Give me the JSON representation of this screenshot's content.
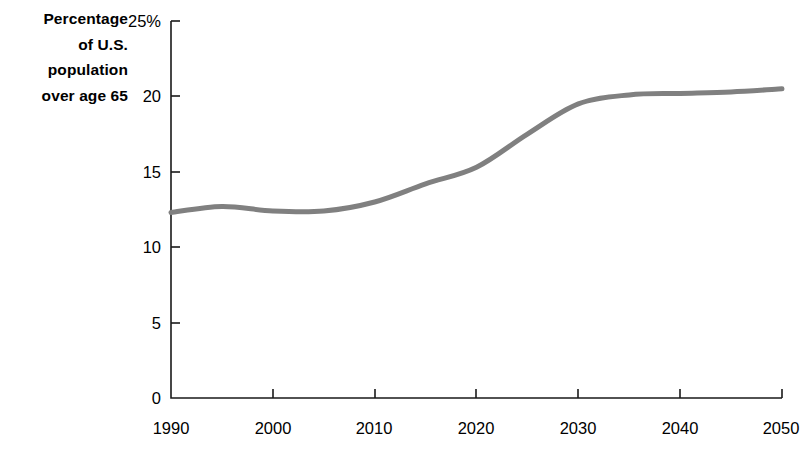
{
  "chart_data": {
    "type": "line",
    "title": "",
    "ylabel_lines": [
      "Percentage",
      "of U.S.",
      "population",
      "over age 65"
    ],
    "ylabel": "Percentage of U.S. population over age 65",
    "xlabel": "",
    "xlim": [
      1990,
      2050
    ],
    "ylim": [
      0,
      25
    ],
    "grid": false,
    "legend": null,
    "y_tick_labels": [
      "25%",
      "20",
      "15",
      "10",
      "5",
      "0"
    ],
    "y_tick_values": [
      25,
      20,
      15,
      10,
      5,
      0
    ],
    "x_tick_labels": [
      "1990",
      "2000",
      "2010",
      "2020",
      "2030",
      "2040",
      "2050"
    ],
    "x_tick_values": [
      1990,
      2000,
      2010,
      2020,
      2030,
      2040,
      2050
    ],
    "series": [
      {
        "name": "Percentage of U.S. population over age 65",
        "color": "#808080",
        "line_width": 5,
        "x": [
          1990,
          1995,
          2000,
          2005,
          2010,
          2015,
          2020,
          2025,
          2030,
          2035,
          2040,
          2045,
          2050
        ],
        "values": [
          12.3,
          12.7,
          12.4,
          12.4,
          13.0,
          14.2,
          15.3,
          17.5,
          19.5,
          20.1,
          20.2,
          20.3,
          20.5
        ]
      }
    ]
  },
  "style": {
    "axis_color": "#1a1a1a",
    "line_color": "#808080",
    "background": "#ffffff"
  },
  "plot_geometry": {
    "left_px": 171,
    "right_px": 782,
    "top_px": 21,
    "bottom_px": 398
  }
}
